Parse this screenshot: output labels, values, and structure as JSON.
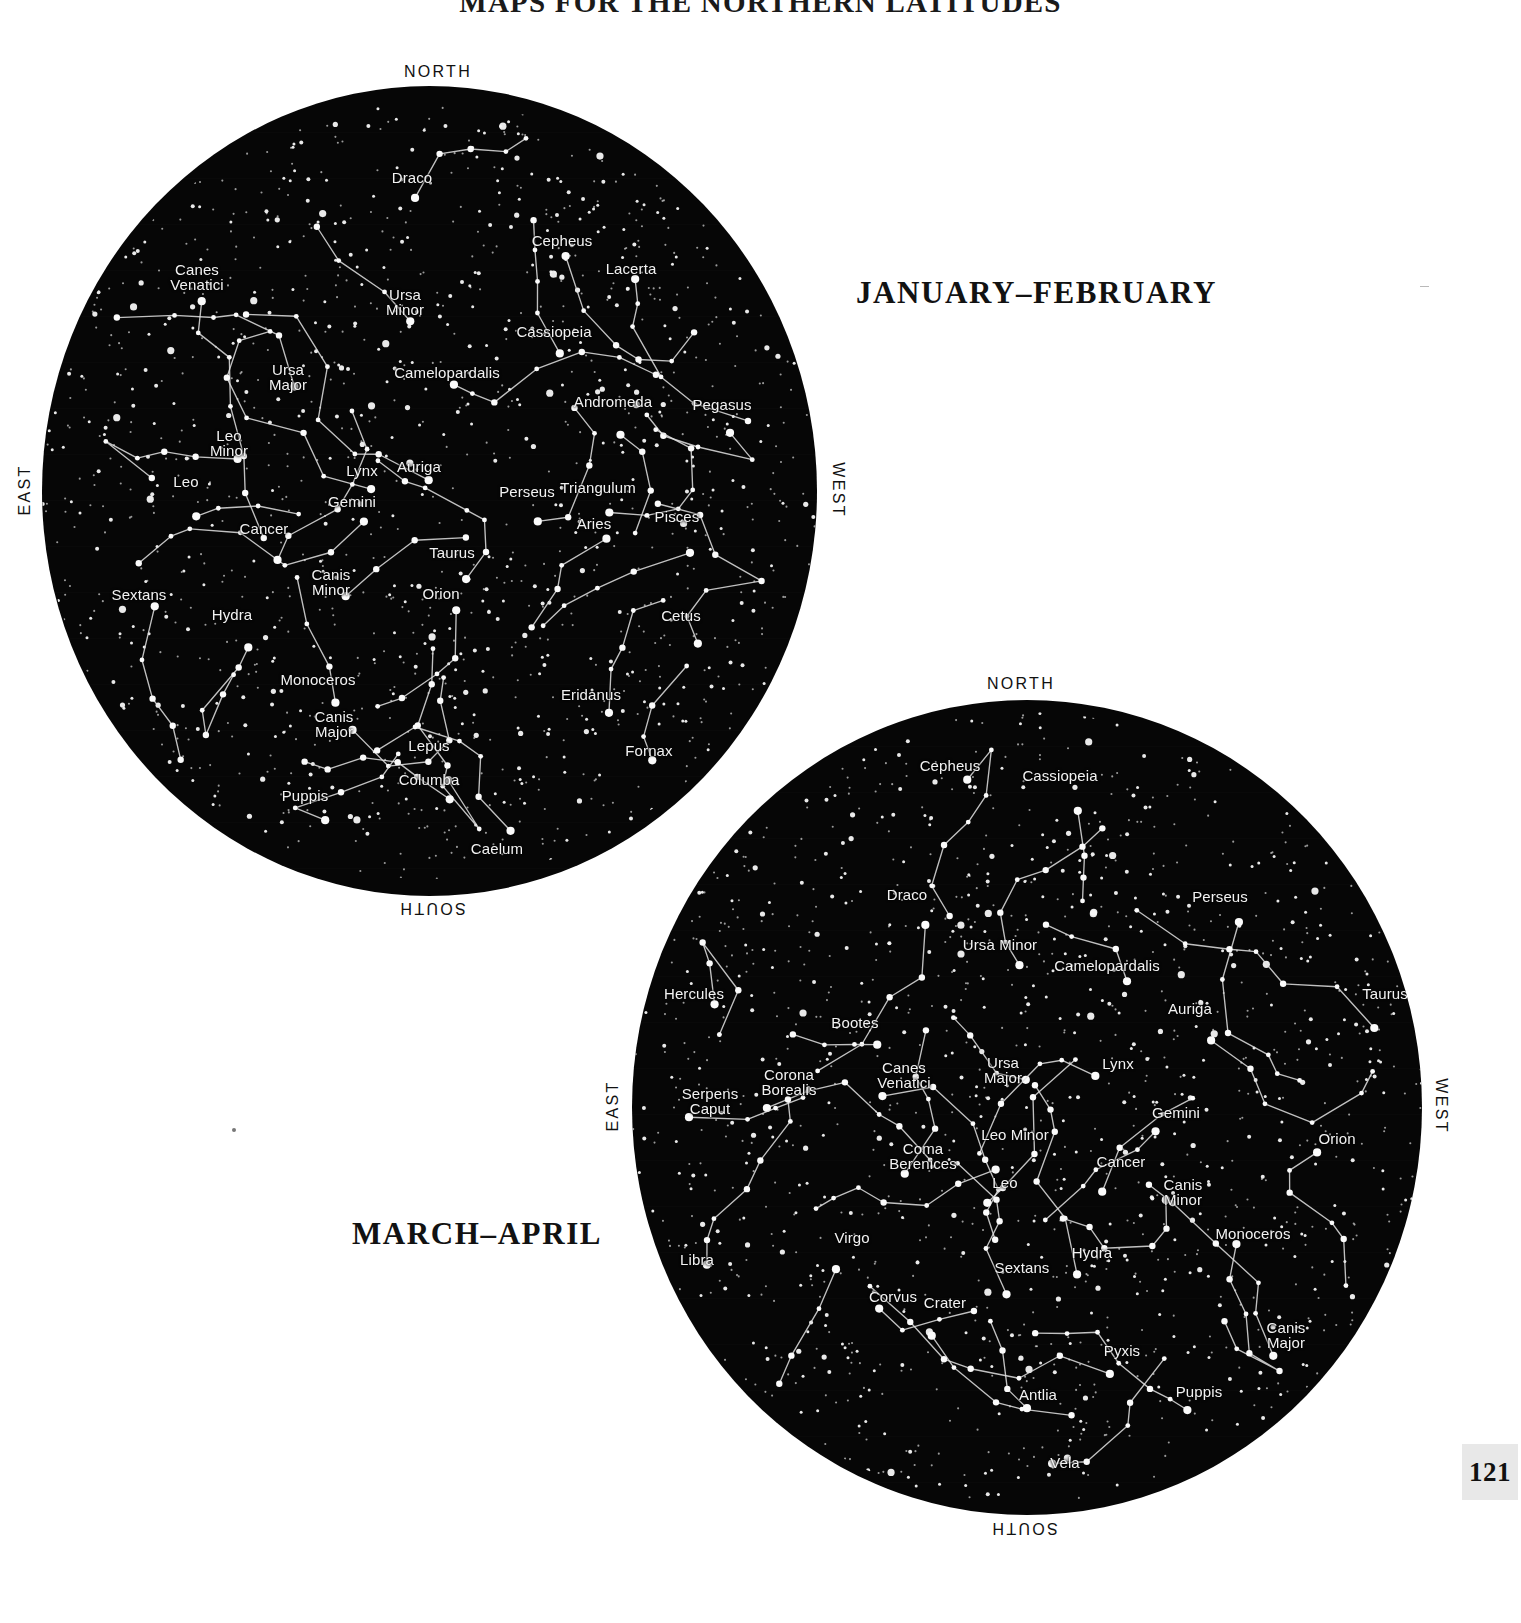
{
  "page": {
    "title": "MAPS FOR THE NORTHERN LATITUDES",
    "number": "121"
  },
  "charts": [
    {
      "id": "chart1",
      "season_label": "JANUARY–FEBRUARY",
      "compass": {
        "north": "NORTH",
        "south": "SOUTH",
        "east": "EAST",
        "west": "WEST"
      },
      "constellations": [
        "Draco",
        "Cepheus",
        "Lacerta",
        "Canes\nVenatici",
        "Ursa\nMinor",
        "Cassiopeia",
        "Ursa\nMajor",
        "Camelopardalis",
        "Andromeda",
        "Pegasus",
        "Leo\nMinor",
        "Lynx",
        "Auriga",
        "Leo",
        "Perseus",
        "Triangulum",
        "Gemini",
        "Aries",
        "Pisces",
        "Cancer",
        "Taurus",
        "Canis\nMinor",
        "Orion",
        "Sextans",
        "Hydra",
        "Cetus",
        "Monoceros",
        "Eridanus",
        "Canis\nMajor",
        "Lepus",
        "Fornax",
        "Puppis",
        "Columba",
        "Caelum"
      ]
    },
    {
      "id": "chart2",
      "season_label": "MARCH–APRIL",
      "compass": {
        "north": "NORTH",
        "south": "SOUTH",
        "east": "EAST",
        "west": "WEST"
      },
      "constellations": [
        "Cepheus",
        "Cassiopeia",
        "Draco",
        "Perseus",
        "Ursa Minor",
        "Camelopardalis",
        "Hercules",
        "Auriga",
        "Taurus",
        "Bootes",
        "Ursa\nMajor",
        "Lynx",
        "Corona\nBorealis",
        "Canes\nVenatici",
        "Serpens\nCaput",
        "Gemini",
        "Orion",
        "Leo Minor",
        "Cancer",
        "Coma\nBerenices",
        "Leo",
        "Canis\nMinor",
        "Monoceros",
        "Virgo",
        "Sextans",
        "Hydra",
        "Libra",
        "Corvus",
        "Crater",
        "Canis\nMajor",
        "Pyxis",
        "Puppis",
        "Antlia",
        "Vela"
      ]
    }
  ],
  "chart_data": {
    "type": "scatter",
    "title": "MAPS FOR THE NORTHERN LATITUDES",
    "subtitle": "Star charts of the northern sky",
    "xlabel": "",
    "ylabel": "",
    "legend_position": "none",
    "grid": false,
    "panels": [
      {
        "name": "JANUARY–FEBRUARY",
        "projection": "polar-horizon",
        "center_x": 430,
        "center_y": 491,
        "radius": 388,
        "cardinal_points": {
          "top": "NORTH",
          "bottom": "SOUTH",
          "left": "EAST",
          "right": "WEST"
        },
        "labels": [
          {
            "text": "Draco",
            "x": 412,
            "y": 170
          },
          {
            "text": "Cepheus",
            "x": 562,
            "y": 233
          },
          {
            "text": "Lacerta",
            "x": 631,
            "y": 261
          },
          {
            "text": "Canes\nVenatici",
            "x": 197,
            "y": 262
          },
          {
            "text": "Ursa\nMinor",
            "x": 405,
            "y": 287
          },
          {
            "text": "Cassiopeia",
            "x": 554,
            "y": 324
          },
          {
            "text": "Ursa\nMajor",
            "x": 288,
            "y": 362
          },
          {
            "text": "Camelopardalis",
            "x": 447,
            "y": 365
          },
          {
            "text": "Andromeda",
            "x": 613,
            "y": 394
          },
          {
            "text": "Pegasus",
            "x": 722,
            "y": 397
          },
          {
            "text": "Leo\nMinor",
            "x": 229,
            "y": 428
          },
          {
            "text": "Lynx",
            "x": 362,
            "y": 463
          },
          {
            "text": "Auriga",
            "x": 419,
            "y": 459
          },
          {
            "text": "Leo",
            "x": 186,
            "y": 474
          },
          {
            "text": "Perseus",
            "x": 527,
            "y": 484
          },
          {
            "text": "Triangulum",
            "x": 598,
            "y": 480
          },
          {
            "text": "Gemini",
            "x": 352,
            "y": 494
          },
          {
            "text": "Aries",
            "x": 594,
            "y": 516
          },
          {
            "text": "Pisces",
            "x": 677,
            "y": 509
          },
          {
            "text": "Cancer",
            "x": 264,
            "y": 521
          },
          {
            "text": "Taurus",
            "x": 452,
            "y": 545
          },
          {
            "text": "Canis\nMinor",
            "x": 331,
            "y": 567
          },
          {
            "text": "Orion",
            "x": 441,
            "y": 586
          },
          {
            "text": "Sextans",
            "x": 139,
            "y": 587
          },
          {
            "text": "Hydra",
            "x": 232,
            "y": 607
          },
          {
            "text": "Cetus",
            "x": 681,
            "y": 608
          },
          {
            "text": "Monoceros",
            "x": 318,
            "y": 672
          },
          {
            "text": "Eridanus",
            "x": 591,
            "y": 687
          },
          {
            "text": "Canis\nMajor",
            "x": 334,
            "y": 709
          },
          {
            "text": "Lepus",
            "x": 429,
            "y": 738
          },
          {
            "text": "Fornax",
            "x": 649,
            "y": 743
          },
          {
            "text": "Puppis",
            "x": 305,
            "y": 788
          },
          {
            "text": "Columba",
            "x": 429,
            "y": 772
          },
          {
            "text": "Caelum",
            "x": 497,
            "y": 841
          }
        ]
      },
      {
        "name": "MARCH–APRIL",
        "projection": "polar-horizon",
        "center_x": 1027,
        "center_y": 1108,
        "radius": 396,
        "cardinal_points": {
          "top": "NORTH",
          "bottom": "SOUTH",
          "left": "EAST",
          "right": "WEST"
        },
        "labels": [
          {
            "text": "Cepheus",
            "x": 950,
            "y": 758
          },
          {
            "text": "Cassiopeia",
            "x": 1060,
            "y": 768
          },
          {
            "text": "Draco",
            "x": 907,
            "y": 887
          },
          {
            "text": "Perseus",
            "x": 1220,
            "y": 889
          },
          {
            "text": "Ursa Minor",
            "x": 1000,
            "y": 937
          },
          {
            "text": "Camelopardalis",
            "x": 1107,
            "y": 958
          },
          {
            "text": "Hercules",
            "x": 694,
            "y": 986
          },
          {
            "text": "Auriga",
            "x": 1190,
            "y": 1001
          },
          {
            "text": "Taurus",
            "x": 1385,
            "y": 986
          },
          {
            "text": "Bootes",
            "x": 855,
            "y": 1015
          },
          {
            "text": "Ursa\nMajor",
            "x": 1003,
            "y": 1055
          },
          {
            "text": "Lynx",
            "x": 1118,
            "y": 1056
          },
          {
            "text": "Corona\nBorealis",
            "x": 789,
            "y": 1067
          },
          {
            "text": "Canes\nVenatici",
            "x": 904,
            "y": 1060
          },
          {
            "text": "Serpens\nCaput",
            "x": 710,
            "y": 1086
          },
          {
            "text": "Gemini",
            "x": 1176,
            "y": 1105
          },
          {
            "text": "Orion",
            "x": 1337,
            "y": 1131
          },
          {
            "text": "Leo Minor",
            "x": 1015,
            "y": 1127
          },
          {
            "text": "Cancer",
            "x": 1121,
            "y": 1154
          },
          {
            "text": "Coma\nBerenices",
            "x": 923,
            "y": 1141
          },
          {
            "text": "Leo",
            "x": 1005,
            "y": 1175
          },
          {
            "text": "Canis\nMinor",
            "x": 1183,
            "y": 1177
          },
          {
            "text": "Monoceros",
            "x": 1253,
            "y": 1226
          },
          {
            "text": "Virgo",
            "x": 852,
            "y": 1230
          },
          {
            "text": "Sextans",
            "x": 1022,
            "y": 1260
          },
          {
            "text": "Hydra",
            "x": 1092,
            "y": 1245
          },
          {
            "text": "Libra",
            "x": 697,
            "y": 1252
          },
          {
            "text": "Corvus",
            "x": 893,
            "y": 1289
          },
          {
            "text": "Crater",
            "x": 945,
            "y": 1295
          },
          {
            "text": "Canis\nMajor",
            "x": 1286,
            "y": 1320
          },
          {
            "text": "Pyxis",
            "x": 1122,
            "y": 1343
          },
          {
            "text": "Puppis",
            "x": 1199,
            "y": 1384
          },
          {
            "text": "Antlia",
            "x": 1038,
            "y": 1387
          },
          {
            "text": "Vela",
            "x": 1065,
            "y": 1455
          }
        ]
      }
    ]
  }
}
